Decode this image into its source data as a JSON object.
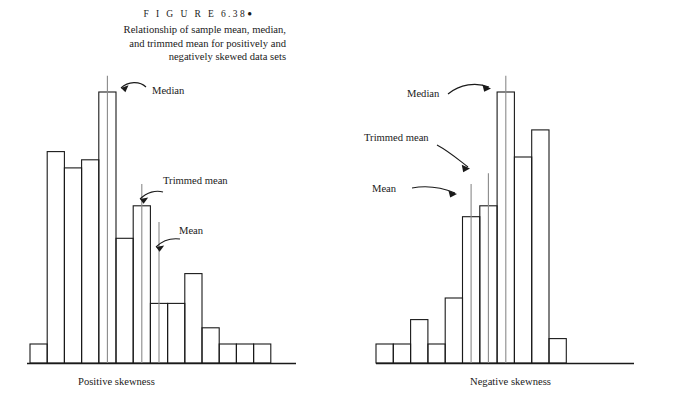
{
  "figure": {
    "label": "F I G U R E  6.38",
    "bullet": "●",
    "caption_line1": "Relationship of sample mean, median,",
    "caption_line2": "and trimmed mean for positively and",
    "caption_line3": "negatively skewed data sets"
  },
  "colors": {
    "ink": "#1a1a1a",
    "stat_line": "#8a8a8a",
    "background": "#ffffff"
  },
  "chart_data": [
    {
      "type": "bar",
      "id": "positive-skew-histogram",
      "title": "Positive skewness",
      "xlabel": "",
      "ylabel": "",
      "grid": false,
      "legend": "none",
      "axis_visible": {
        "x": true,
        "y": false
      },
      "categories": [
        "1",
        "2",
        "3",
        "4",
        "5",
        "6",
        "7",
        "8",
        "9",
        "10",
        "11",
        "12",
        "13",
        "14",
        "15"
      ],
      "values": [
        0.07,
        0.78,
        0.72,
        0.75,
        1.0,
        0.46,
        0.58,
        0.22,
        0.22,
        0.33,
        0.13,
        0.07,
        0.07,
        0.07,
        0.0
      ],
      "ylim": [
        0,
        1.0
      ],
      "annotations": [
        {
          "name": "median",
          "label": "Median",
          "bar_index": 5,
          "value": 1.06
        },
        {
          "name": "trimmed-mean",
          "label": "Trimmed mean",
          "bar_index": 7,
          "value": 0.66
        },
        {
          "name": "mean",
          "label": "Mean",
          "bar_index": 8,
          "value": 0.52
        }
      ]
    },
    {
      "type": "bar",
      "id": "negative-skew-histogram",
      "title": "Negative skewness",
      "xlabel": "",
      "ylabel": "",
      "grid": false,
      "legend": "none",
      "axis_visible": {
        "x": true,
        "y": false
      },
      "categories": [
        "1",
        "2",
        "3",
        "4",
        "5",
        "6",
        "7",
        "8",
        "9",
        "10",
        "11"
      ],
      "values": [
        0.07,
        0.07,
        0.16,
        0.07,
        0.24,
        0.54,
        0.58,
        1.0,
        0.76,
        0.86,
        0.09
      ],
      "ylim": [
        0,
        1.0
      ],
      "annotations": [
        {
          "name": "median",
          "label": "Median",
          "bar_index": 8,
          "value": 1.06
        },
        {
          "name": "trimmed-mean",
          "label": "Trimmed mean",
          "bar_index": 7,
          "value": 0.7
        },
        {
          "name": "mean",
          "label": "Mean",
          "bar_index": 6,
          "value": 0.66
        }
      ]
    }
  ],
  "panels": {
    "left": {
      "caption": "Positive skewness",
      "median_label": "Median",
      "trimmed_mean_label": "Trimmed mean",
      "mean_label": "Mean"
    },
    "right": {
      "caption": "Negative skewness",
      "median_label": "Median",
      "trimmed_mean_label": "Trimmed mean",
      "mean_label": "Mean"
    }
  }
}
